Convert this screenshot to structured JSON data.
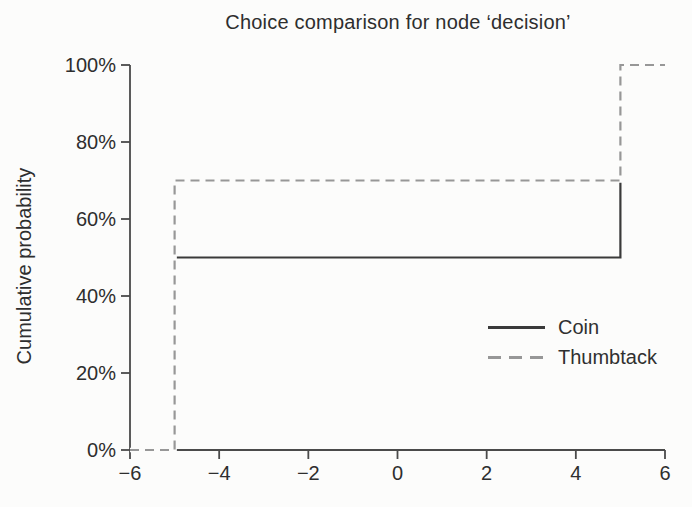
{
  "title": "Choice comparison for node ‘decision’",
  "colors": {
    "coin_line": "#3a3a3a",
    "thumbtack_line": "#979797",
    "axis": "#4a4a4a",
    "text": "#2e2e2e",
    "background": "#fcfcfb"
  },
  "chart_data": {
    "type": "line",
    "subtype": "step-cdf-risk-profile",
    "title": "Choice comparison for node ‘decision’",
    "xlabel": "",
    "ylabel": "Cumulative probability",
    "xlim": [
      -6,
      6
    ],
    "ylim_percent": [
      0,
      100
    ],
    "x_ticks": [
      -6,
      -4,
      -2,
      0,
      2,
      4,
      6
    ],
    "x_tick_labels": [
      "−6",
      "−4",
      "−2",
      "0",
      "2",
      "4",
      "6"
    ],
    "y_ticks_percent": [
      0,
      20,
      40,
      60,
      80,
      100
    ],
    "y_tick_labels": [
      "0%",
      "20%",
      "40%",
      "60%",
      "80%",
      "100%"
    ],
    "grid": false,
    "legend_position": "inside lower right",
    "series": [
      {
        "name": "Coin",
        "style": "solid",
        "color": "#3a3a3a",
        "points": [
          {
            "x": -6,
            "p": 0
          },
          {
            "x": -5,
            "p": 0
          },
          {
            "x": -5,
            "p": 50
          },
          {
            "x": 5,
            "p": 50
          },
          {
            "x": 5,
            "p": 100
          },
          {
            "x": 6,
            "p": 100
          }
        ]
      },
      {
        "name": "Thumbtack",
        "style": "dashed",
        "color": "#979797",
        "points": [
          {
            "x": -6,
            "p": 0
          },
          {
            "x": -5,
            "p": 0
          },
          {
            "x": -5,
            "p": 70
          },
          {
            "x": 5,
            "p": 70
          },
          {
            "x": 5,
            "p": 100
          },
          {
            "x": 6,
            "p": 100
          }
        ]
      }
    ]
  },
  "legend": {
    "items": [
      {
        "label": "Coin",
        "style": "solid"
      },
      {
        "label": "Thumbtack",
        "style": "dashed"
      }
    ]
  }
}
